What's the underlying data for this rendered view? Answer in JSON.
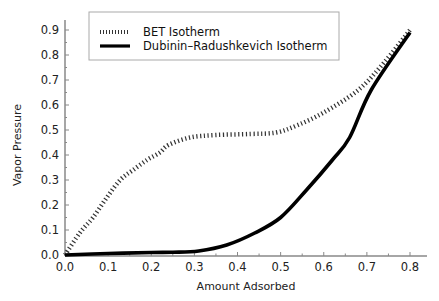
{
  "chart_data": {
    "type": "line",
    "title": "",
    "xlabel": "Amount Adsorbed",
    "ylabel": "Vapor Pressure",
    "xlim": [
      0.0,
      0.8
    ],
    "ylim": [
      0.0,
      0.9
    ],
    "xticks": [
      "0.0",
      "0.1",
      "0.2",
      "0.3",
      "0.4",
      "0.5",
      "0.6",
      "0.7",
      "0.8"
    ],
    "yticks": [
      "0.0",
      "0.1",
      "0.2",
      "0.3",
      "0.4",
      "0.5",
      "0.6",
      "0.7",
      "0.8",
      "0.9"
    ],
    "grid": false,
    "legend_position": "upper left",
    "series": [
      {
        "name": "BET Isotherm",
        "style": "dotted",
        "color": "#333333",
        "x": [
          0.0,
          0.035,
          0.065,
          0.097,
          0.128,
          0.158,
          0.19,
          0.22,
          0.24,
          0.29,
          0.35,
          0.43,
          0.49,
          0.54,
          0.6,
          0.68,
          0.74,
          0.8
        ],
        "y": [
          0.0,
          0.09,
          0.15,
          0.23,
          0.3,
          0.34,
          0.38,
          0.41,
          0.44,
          0.47,
          0.48,
          0.484,
          0.49,
          0.52,
          0.57,
          0.66,
          0.77,
          0.9
        ]
      },
      {
        "name": "Dubinin–Radushkevich Isotherm",
        "style": "solid",
        "color": "#000000",
        "x": [
          0.0,
          0.1,
          0.2,
          0.25,
          0.31,
          0.375,
          0.44,
          0.5,
          0.56,
          0.62,
          0.66,
          0.71,
          0.8
        ],
        "y": [
          0.0,
          0.006,
          0.01,
          0.011,
          0.016,
          0.04,
          0.088,
          0.15,
          0.26,
          0.38,
          0.47,
          0.66,
          0.89
        ]
      }
    ]
  },
  "legend": {
    "items": [
      {
        "label": "BET Isotherm"
      },
      {
        "label": "Dubinin–Radushkevich Isotherm"
      }
    ]
  },
  "axes": {
    "xlabel": "Amount Adsorbed",
    "ylabel": "Vapor Pressure"
  }
}
